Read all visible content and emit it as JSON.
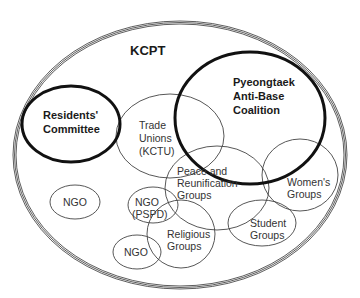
{
  "diagram": {
    "title": "KCPT",
    "type": "euler-venn",
    "container": {
      "name": "KCPT",
      "cx": 180,
      "cy": 155,
      "rx": 167,
      "ry": 134
    },
    "groups": [
      {
        "id": "residents",
        "lines": [
          "Residents'",
          "Committee"
        ],
        "emphasis": "bold",
        "cx": 71,
        "cy": 124,
        "rx": 49,
        "ry": 38
      },
      {
        "id": "pyeongtaek",
        "lines": [
          "Pyeongtaek",
          "Anti-Base",
          "Coalition"
        ],
        "emphasis": "bold",
        "cx": 250,
        "cy": 118,
        "rx": 75,
        "ry": 66
      },
      {
        "id": "trade-unions",
        "lines": [
          "Trade",
          "Unions",
          "(KCTU)"
        ],
        "emphasis": "normal",
        "cx": 170,
        "cy": 136,
        "rx": 54,
        "ry": 42
      },
      {
        "id": "peace",
        "lines": [
          "Peace and",
          "Reunification",
          "Groups"
        ],
        "emphasis": "normal",
        "cx": 217,
        "cy": 188,
        "rx": 52,
        "ry": 42
      },
      {
        "id": "womens",
        "lines": [
          "Women's",
          "Groups"
        ],
        "emphasis": "normal",
        "cx": 300,
        "cy": 175,
        "rx": 38,
        "ry": 36
      },
      {
        "id": "student",
        "lines": [
          "Student",
          "Groups"
        ],
        "emphasis": "normal",
        "cx": 262,
        "cy": 223,
        "rx": 34,
        "ry": 23
      },
      {
        "id": "religious",
        "lines": [
          "Religious",
          "Groups"
        ],
        "emphasis": "normal",
        "cx": 181,
        "cy": 234,
        "rx": 34,
        "ry": 34
      },
      {
        "id": "ngo-pspd",
        "lines": [
          "NGO",
          "(PSPD)"
        ],
        "emphasis": "normal",
        "cx": 153,
        "cy": 205,
        "rx": 25,
        "ry": 18
      },
      {
        "id": "ngo-left",
        "lines": [
          "NGO"
        ],
        "emphasis": "normal",
        "cx": 75,
        "cy": 202,
        "rx": 25,
        "ry": 17
      },
      {
        "id": "ngo-bottom",
        "lines": [
          "NGO"
        ],
        "emphasis": "normal",
        "cx": 137,
        "cy": 252,
        "rx": 24,
        "ry": 17
      }
    ]
  }
}
